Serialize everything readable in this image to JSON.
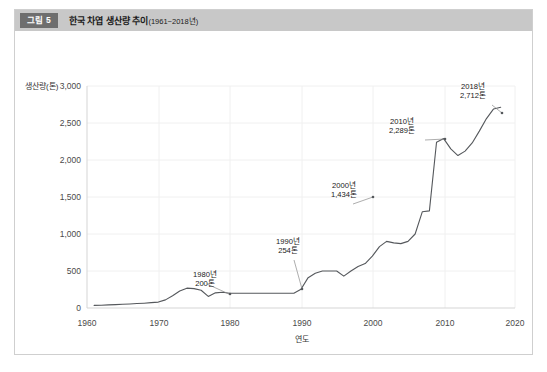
{
  "figure": {
    "badge": "그림 5",
    "title_main": "한국 차엽 생산량 추이",
    "title_range": "(1961~2018년)"
  },
  "chart_data": {
    "type": "line",
    "title": "한국 차엽 생산량 추이(1961~2018년)",
    "xlabel": "연도",
    "ylabel": "생산량(톤)",
    "xlim": [
      1960,
      2020
    ],
    "ylim": [
      0,
      3000
    ],
    "grid": true,
    "legend": "none",
    "xticks": [
      "1960",
      "1970",
      "1980",
      "1990",
      "2000",
      "2010",
      "2020"
    ],
    "yticks": [
      "0",
      "500",
      "1,000",
      "1,500",
      "2,000",
      "2,500",
      "3,000"
    ],
    "x": [
      1961,
      1962,
      1963,
      1964,
      1965,
      1966,
      1967,
      1968,
      1969,
      1970,
      1971,
      1972,
      1973,
      1974,
      1975,
      1976,
      1977,
      1978,
      1979,
      1980,
      1981,
      1982,
      1983,
      1984,
      1985,
      1986,
      1987,
      1988,
      1989,
      1990,
      1991,
      1992,
      1993,
      1994,
      1995,
      1996,
      1997,
      1998,
      1999,
      2000,
      2001,
      2002,
      2003,
      2004,
      2005,
      2006,
      2007,
      2008,
      2009,
      2010,
      2011,
      2012,
      2013,
      2014,
      2015,
      2016,
      2017,
      2018
    ],
    "values": [
      35,
      38,
      42,
      45,
      50,
      55,
      60,
      65,
      72,
      80,
      110,
      165,
      230,
      268,
      262,
      240,
      156,
      205,
      212,
      200,
      200,
      200,
      200,
      200,
      200,
      200,
      200,
      200,
      200,
      254,
      410,
      470,
      500,
      500,
      500,
      430,
      500,
      560,
      600,
      700,
      830,
      900,
      880,
      870,
      900,
      1000,
      1180,
      1434,
      1180,
      1434,
      1370,
      1400,
      1430,
      1410,
      1340,
      1310,
      1300,
      1312
    ],
    "annotations": [
      {
        "label_year": "1980년",
        "label_value": "200톤",
        "x": 1980,
        "y": 200
      },
      {
        "label_year": "1990년",
        "label_value": "254톤",
        "x": 1990,
        "y": 254
      },
      {
        "label_year": "2000년",
        "label_value": "1,434톤",
        "x": 2000,
        "y": 1434
      },
      {
        "label_year": "2010년",
        "label_value": "2,289톤",
        "x": 2010,
        "y": 2289
      },
      {
        "label_year": "2018년",
        "label_value": "2,712톤",
        "x": 2018,
        "y": 2712
      }
    ],
    "series_late": {
      "note": "steep rise 2008-2010 then plateau then rise to 2018",
      "x": [
        2007,
        2008,
        2009,
        2010,
        2011,
        2012,
        2013,
        2014,
        2015,
        2016,
        2017,
        2018
      ],
      "values": [
        1300,
        1312,
        2240,
        2289,
        2150,
        2060,
        2120,
        2230,
        2390,
        2560,
        2690,
        2712
      ]
    }
  }
}
